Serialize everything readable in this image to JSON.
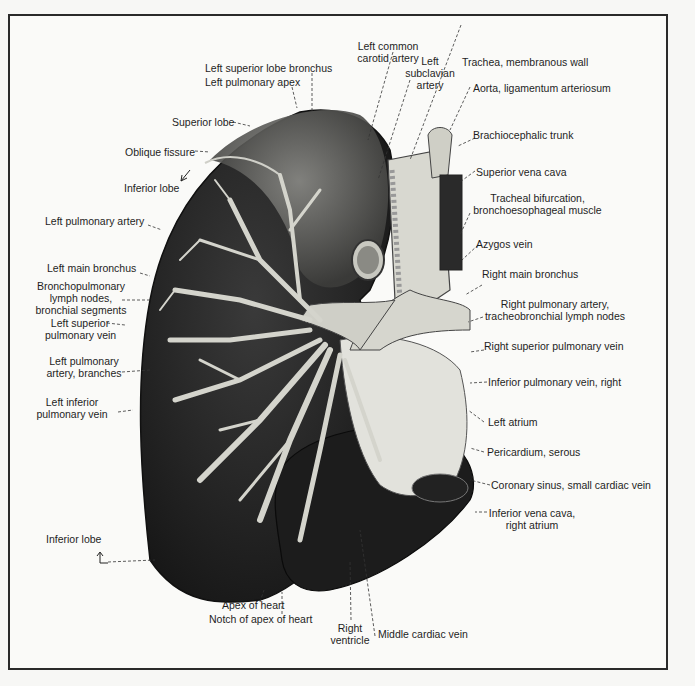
{
  "figure": {
    "labels": {
      "left_superior_lobe_bronchus": "Left superior lobe bronchus",
      "left_pulmonary_apex": "Left pulmonary apex",
      "superior_lobe": "Superior lobe",
      "oblique_fissure": "Oblique fissure",
      "inferior_lobe_top": "Inferior lobe",
      "left_pulmonary_artery": "Left pulmonary artery",
      "left_main_bronchus": "Left main bronchus",
      "bronchopulmonary_1": "Bronchopulmonary",
      "bronchopulmonary_2": "lymph nodes,",
      "bronchopulmonary_3": "bronchial segments",
      "left_superior_pv_1": "Left superior",
      "left_superior_pv_2": "pulmonary vein",
      "left_pa_branches_1": "Left pulmonary",
      "left_pa_branches_2": "artery, branches",
      "left_inferior_pv_1": "Left inferior",
      "left_inferior_pv_2": "pulmonary vein",
      "inferior_lobe_bottom": "Inferior lobe",
      "left_common_carotid_1": "Left common",
      "left_common_carotid_2": "carotid artery",
      "left_subclavian_1": "Left",
      "left_subclavian_2": "subclavian",
      "left_subclavian_3": "artery",
      "trachea": "Trachea, membranous wall",
      "aorta": "Aorta, ligamentum arteriosum",
      "brachiocephalic": "Brachiocephalic trunk",
      "superior_vena_cava": "Superior vena cava",
      "tracheal_bifurcation_1": "Tracheal bifurcation,",
      "tracheal_bifurcation_2": "bronchoesophageal muscle",
      "azygos": "Azygos vein",
      "right_main_bronchus": "Right main bronchus",
      "right_pa_1": "Right pulmonary artery,",
      "right_pa_2": "tracheobronchial lymph nodes",
      "right_superior_pv": "Right superior pulmonary vein",
      "inferior_pv_right": "Inferior pulmonary vein, right",
      "left_atrium": "Left atrium",
      "pericardium": "Pericardium, serous",
      "coronary_sinus": "Coronary sinus, small cardiac vein",
      "ivc_1": "Inferior vena cava,",
      "ivc_2": "right atrium",
      "apex_of_heart": "Apex of heart",
      "notch_of_apex": "Notch of apex of heart",
      "right_ventricle_1": "Right",
      "right_ventricle_2": "ventricle",
      "middle_cardiac_vein": "Middle cardiac vein"
    }
  }
}
